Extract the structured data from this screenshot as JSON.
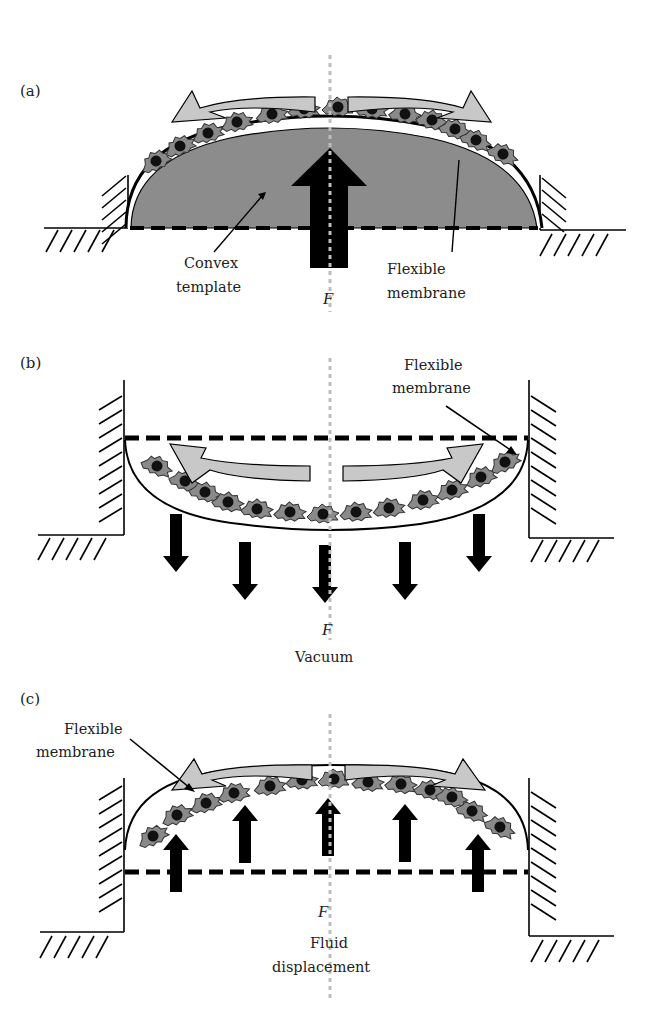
{
  "figure": {
    "colors": {
      "template_fill": "#8c8c8c",
      "cell_fill": "#8a8a8a",
      "nucleus": "#111111",
      "flow_arrow_fill": "#c8c8c8",
      "force_arrow": "#000000",
      "axis_line": "#bdbdbd",
      "stroke": "#000000"
    },
    "panels": [
      {
        "id": "a",
        "label": "(a)",
        "annotations": {
          "template": [
            "Convex",
            "template"
          ],
          "membrane": [
            "Flexible",
            "membrane"
          ],
          "force": "F"
        },
        "description": "Convex template pushed up against flexible membrane with cells; single large upward force arrow"
      },
      {
        "id": "b",
        "label": "(b)",
        "annotations": {
          "membrane": [
            "Flexible",
            "membrane"
          ],
          "force": "F",
          "caption": "Vacuum"
        },
        "description": "Membrane pulled downward by vacuum; five downward force arrows"
      },
      {
        "id": "c",
        "label": "(c)",
        "annotations": {
          "membrane": [
            "Flexible",
            "membrane"
          ],
          "force": "F",
          "caption": [
            "Fluid",
            "displacement"
          ]
        },
        "description": "Membrane pushed upward by fluid displacement; five upward force arrows"
      }
    ]
  }
}
